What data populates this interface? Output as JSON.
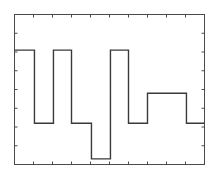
{
  "figure": {
    "background_color": "#ffffff",
    "width": 217,
    "height": 187
  },
  "chart_data": {
    "type": "line",
    "title": "",
    "subtitle": "",
    "xlabel": "",
    "ylabel": "",
    "grid": false,
    "legend": null,
    "legend_position": "none",
    "annotations": [],
    "line_style": "step-post",
    "line_color": "#3a3a3a",
    "line_width": 1.4,
    "axis_color": "#4a4a4a",
    "axis_line_width": 1.0,
    "tick_direction": "in",
    "tick_length": 3,
    "xlim": [
      0,
      10
    ],
    "ylim": [
      0,
      8
    ],
    "xticks": [
      0,
      1,
      2,
      3,
      4,
      5,
      6,
      7,
      8,
      9,
      10
    ],
    "yticks": [
      0,
      1,
      2,
      3,
      4,
      5,
      6,
      7,
      8
    ],
    "xtick_labels": [
      "",
      "",
      "",
      "",
      "",
      "",
      "",
      "",
      "",
      "",
      ""
    ],
    "ytick_labels": [
      "",
      "",
      "",
      "",
      "",
      "",
      "",
      "",
      ""
    ],
    "x": [
      0,
      1.05,
      2.05,
      3.0,
      4.05,
      5.05,
      6.0,
      7.0,
      7.8,
      9.05,
      10
    ],
    "y": [
      6.1,
      2.2,
      6.1,
      2.2,
      0.3,
      0.3,
      6.1,
      2.2,
      3.8,
      2.2,
      2.2
    ],
    "levels": {
      "high": 6.1,
      "intermediate": 3.8,
      "mid": 2.2,
      "low": 0.3
    },
    "segments": [
      {
        "x_start": 0.0,
        "x_end": 1.05,
        "level": 6.1
      },
      {
        "x_start": 1.05,
        "x_end": 2.05,
        "level": 2.2
      },
      {
        "x_start": 2.05,
        "x_end": 3.0,
        "level": 6.1
      },
      {
        "x_start": 3.0,
        "x_end": 4.05,
        "level": 2.2
      },
      {
        "x_start": 4.05,
        "x_end": 5.05,
        "level": 0.3
      },
      {
        "x_start": 5.05,
        "x_end": 6.0,
        "level": 6.1
      },
      {
        "x_start": 6.0,
        "x_end": 7.0,
        "level": 2.2
      },
      {
        "x_start": 7.0,
        "x_end": 7.8,
        "level": 3.8
      },
      {
        "x_start": 7.8,
        "x_end": 9.05,
        "level": 3.8
      },
      {
        "x_start": 9.05,
        "x_end": 10.0,
        "level": 2.2
      }
    ]
  }
}
